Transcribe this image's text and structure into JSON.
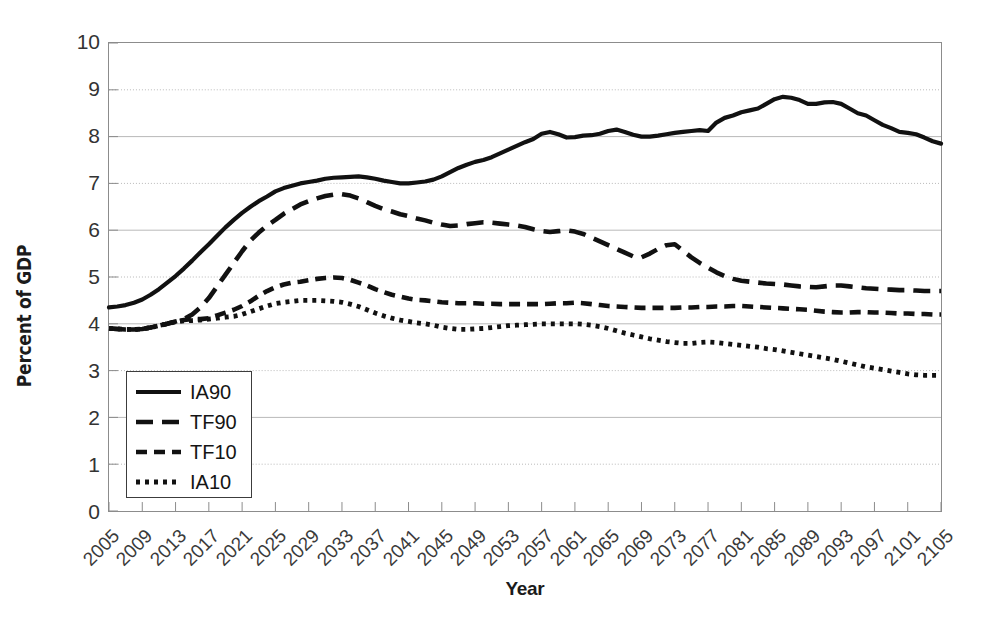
{
  "chart_data": {
    "type": "line",
    "title": "",
    "xlabel": "Year",
    "ylabel": "Percent of GDP",
    "xlim": [
      2005,
      2105
    ],
    "ylim": [
      0,
      10
    ],
    "yticks": [
      0,
      1,
      2,
      3,
      4,
      5,
      6,
      7,
      8,
      9,
      10
    ],
    "xticks": [
      2005,
      2009,
      2013,
      2017,
      2021,
      2025,
      2029,
      2033,
      2037,
      2041,
      2045,
      2049,
      2053,
      2057,
      2061,
      2065,
      2069,
      2073,
      2077,
      2081,
      2085,
      2089,
      2093,
      2097,
      2101,
      2105
    ],
    "grid": "horizontal",
    "legend_position": "lower-left",
    "x": [
      2005,
      2006,
      2007,
      2008,
      2009,
      2010,
      2011,
      2012,
      2013,
      2014,
      2015,
      2016,
      2017,
      2018,
      2019,
      2020,
      2021,
      2022,
      2023,
      2024,
      2025,
      2026,
      2027,
      2028,
      2029,
      2030,
      2031,
      2032,
      2033,
      2034,
      2035,
      2036,
      2037,
      2038,
      2039,
      2040,
      2041,
      2042,
      2043,
      2044,
      2045,
      2046,
      2047,
      2048,
      2049,
      2050,
      2051,
      2052,
      2053,
      2054,
      2055,
      2056,
      2057,
      2058,
      2059,
      2060,
      2061,
      2062,
      2063,
      2064,
      2065,
      2066,
      2067,
      2068,
      2069,
      2070,
      2071,
      2072,
      2073,
      2074,
      2075,
      2076,
      2077,
      2078,
      2079,
      2080,
      2081,
      2082,
      2083,
      2084,
      2085,
      2086,
      2087,
      2088,
      2089,
      2090,
      2091,
      2092,
      2093,
      2094,
      2095,
      2096,
      2097,
      2098,
      2099,
      2100,
      2101,
      2102,
      2103,
      2104,
      2105
    ],
    "series": [
      {
        "name": "IA90",
        "style": "solid",
        "values": [
          4.35,
          4.37,
          4.4,
          4.45,
          4.52,
          4.62,
          4.74,
          4.88,
          5.02,
          5.18,
          5.35,
          5.53,
          5.7,
          5.88,
          6.06,
          6.22,
          6.37,
          6.5,
          6.62,
          6.72,
          6.83,
          6.9,
          6.95,
          7.0,
          7.03,
          7.06,
          7.1,
          7.12,
          7.13,
          7.14,
          7.15,
          7.13,
          7.1,
          7.06,
          7.03,
          7.0,
          7.0,
          7.02,
          7.04,
          7.08,
          7.15,
          7.24,
          7.33,
          7.4,
          7.46,
          7.5,
          7.56,
          7.64,
          7.72,
          7.8,
          7.88,
          7.95,
          8.06,
          8.1,
          8.05,
          7.98,
          7.99,
          8.02,
          8.03,
          8.06,
          8.12,
          8.15,
          8.1,
          8.04,
          8.0,
          8.0,
          8.02,
          8.05,
          8.08,
          8.1,
          8.12,
          8.14,
          8.12,
          8.3,
          8.4,
          8.45,
          8.52,
          8.56,
          8.6,
          8.7,
          8.8,
          8.85,
          8.83,
          8.78,
          8.7,
          8.7,
          8.73,
          8.74,
          8.7,
          8.6,
          8.5,
          8.45,
          8.35,
          8.25,
          8.18,
          8.1,
          8.08,
          8.05,
          7.98,
          7.9,
          7.85
        ]
      },
      {
        "name": "TF90",
        "style": "longdash",
        "values": [
          3.9,
          3.89,
          3.88,
          3.88,
          3.89,
          3.92,
          3.96,
          4.0,
          4.05,
          4.1,
          4.2,
          4.35,
          4.55,
          4.8,
          5.05,
          5.3,
          5.55,
          5.78,
          5.95,
          6.1,
          6.22,
          6.35,
          6.45,
          6.55,
          6.62,
          6.68,
          6.73,
          6.76,
          6.77,
          6.74,
          6.68,
          6.6,
          6.52,
          6.45,
          6.4,
          6.34,
          6.3,
          6.25,
          6.21,
          6.16,
          6.12,
          6.09,
          6.1,
          6.13,
          6.15,
          6.17,
          6.16,
          6.14,
          6.12,
          6.1,
          6.07,
          6.02,
          5.98,
          5.96,
          5.98,
          6.0,
          5.97,
          5.92,
          5.84,
          5.76,
          5.68,
          5.6,
          5.52,
          5.44,
          5.42,
          5.5,
          5.6,
          5.68,
          5.7,
          5.56,
          5.42,
          5.3,
          5.2,
          5.1,
          5.02,
          4.96,
          4.92,
          4.9,
          4.88,
          4.86,
          4.85,
          4.84,
          4.82,
          4.8,
          4.79,
          4.78,
          4.8,
          4.82,
          4.82,
          4.8,
          4.78,
          4.76,
          4.75,
          4.74,
          4.73,
          4.72,
          4.72,
          4.71,
          4.7,
          4.7,
          4.7
        ]
      },
      {
        "name": "TF10",
        "style": "dash",
        "values": [
          3.9,
          3.89,
          3.88,
          3.88,
          3.89,
          3.92,
          3.96,
          4.0,
          4.05,
          4.08,
          4.1,
          4.1,
          4.12,
          4.18,
          4.24,
          4.3,
          4.38,
          4.48,
          4.6,
          4.7,
          4.78,
          4.84,
          4.88,
          4.9,
          4.93,
          4.96,
          4.98,
          4.99,
          4.98,
          4.94,
          4.88,
          4.82,
          4.74,
          4.68,
          4.62,
          4.58,
          4.54,
          4.51,
          4.5,
          4.48,
          4.46,
          4.45,
          4.44,
          4.44,
          4.44,
          4.43,
          4.43,
          4.42,
          4.42,
          4.42,
          4.42,
          4.42,
          4.42,
          4.43,
          4.44,
          4.44,
          4.45,
          4.44,
          4.42,
          4.4,
          4.38,
          4.37,
          4.36,
          4.35,
          4.34,
          4.34,
          4.34,
          4.34,
          4.34,
          4.35,
          4.35,
          4.36,
          4.36,
          4.37,
          4.37,
          4.38,
          4.38,
          4.37,
          4.36,
          4.35,
          4.34,
          4.33,
          4.32,
          4.31,
          4.3,
          4.28,
          4.26,
          4.25,
          4.24,
          4.24,
          4.25,
          4.25,
          4.24,
          4.24,
          4.23,
          4.22,
          4.22,
          4.21,
          4.21,
          4.2,
          4.2
        ]
      },
      {
        "name": "IA10",
        "style": "dot",
        "values": [
          3.9,
          3.89,
          3.88,
          3.88,
          3.89,
          3.92,
          3.96,
          4.0,
          4.04,
          4.06,
          4.07,
          4.08,
          4.1,
          4.12,
          4.14,
          4.16,
          4.2,
          4.26,
          4.32,
          4.38,
          4.43,
          4.46,
          4.48,
          4.5,
          4.5,
          4.5,
          4.49,
          4.48,
          4.46,
          4.42,
          4.37,
          4.3,
          4.23,
          4.17,
          4.12,
          4.08,
          4.05,
          4.02,
          4.0,
          3.97,
          3.93,
          3.9,
          3.88,
          3.88,
          3.89,
          3.9,
          3.92,
          3.94,
          3.96,
          3.97,
          3.98,
          3.99,
          4.0,
          4.0,
          4.0,
          4.0,
          4.0,
          3.99,
          3.97,
          3.94,
          3.9,
          3.85,
          3.8,
          3.76,
          3.72,
          3.68,
          3.65,
          3.62,
          3.6,
          3.58,
          3.58,
          3.6,
          3.61,
          3.6,
          3.58,
          3.56,
          3.54,
          3.52,
          3.5,
          3.47,
          3.45,
          3.42,
          3.39,
          3.36,
          3.33,
          3.3,
          3.27,
          3.24,
          3.2,
          3.16,
          3.12,
          3.08,
          3.05,
          3.02,
          2.99,
          2.96,
          2.93,
          2.91,
          2.9,
          2.9,
          2.9
        ]
      }
    ]
  },
  "axes": {
    "ylabel": "Percent of GDP",
    "xlabel": "Year",
    "yticks": [
      "10",
      "9",
      "8",
      "7",
      "6",
      "5",
      "4",
      "3",
      "2",
      "1",
      "0"
    ],
    "xticks": [
      "2005",
      "2009",
      "2013",
      "2017",
      "2021",
      "2025",
      "2029",
      "2033",
      "2037",
      "2041",
      "2045",
      "2049",
      "2053",
      "2057",
      "2061",
      "2065",
      "2069",
      "2073",
      "2077",
      "2081",
      "2085",
      "2089",
      "2093",
      "2097",
      "2101",
      "2105"
    ]
  },
  "legend": {
    "items": [
      {
        "label": "IA90",
        "style": "solid"
      },
      {
        "label": "TF90",
        "style": "longdash"
      },
      {
        "label": "TF10",
        "style": "dash"
      },
      {
        "label": "IA10",
        "style": "dot"
      }
    ]
  },
  "colors": {
    "line": "#111111",
    "grid": "#b9b9b9",
    "frame": "#8c8c8c",
    "text": "#1b1b1b",
    "background": "#ffffff"
  }
}
